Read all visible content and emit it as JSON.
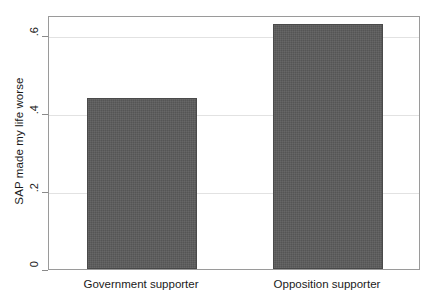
{
  "chart_data": {
    "type": "bar",
    "title": "",
    "xlabel": "",
    "ylabel": "SAP made my life worse",
    "categories": [
      "Government supporter",
      "Opposition supporter"
    ],
    "values": [
      0.44,
      0.63
    ],
    "ylim": [
      0,
      0.652
    ],
    "yticks": [
      0,
      0.2,
      0.4,
      0.6
    ],
    "ytick_labels": [
      "0",
      ".2",
      ".4",
      ".6"
    ],
    "grid": true,
    "legend": "none",
    "bar_color": "#555555",
    "frame_color": "#9a9a9a",
    "gridline_color": "#e2e2e2"
  },
  "axes": {
    "y_title": "SAP made my life worse",
    "y_ticks": [
      {
        "label": ".6",
        "value": 0.6
      },
      {
        "label": ".4",
        "value": 0.4
      },
      {
        "label": ".2",
        "value": 0.2
      },
      {
        "label": "0",
        "value": 0
      }
    ],
    "x_ticks": [
      {
        "label": "Government supporter"
      },
      {
        "label": "Opposition supporter"
      }
    ]
  }
}
